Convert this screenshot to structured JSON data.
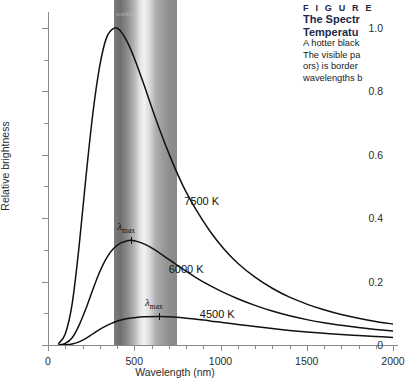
{
  "figure": {
    "label": "F I G U R E",
    "title_line1": "The Spectr",
    "title_line2": "Temperatu",
    "body_line1": "A hotter black",
    "body_line2": "The visible pa",
    "body_line3": "ors) is border",
    "body_line4": "wavelengths b",
    "title_color": "#1b2a4a"
  },
  "band": {
    "caption": "visible",
    "start_nm": 380,
    "end_nm": 750
  },
  "chart_data": {
    "type": "line",
    "title": "",
    "xlabel": "Wavelength (nm)",
    "ylabel": "Relative brightness",
    "xlim": [
      0,
      2000
    ],
    "ylim": [
      0,
      1.05
    ],
    "xticks": [
      0,
      500,
      1000,
      1500,
      2000
    ],
    "xtick_labels": [
      "0",
      "500",
      "1000",
      "1500",
      "2000"
    ],
    "xminor_step": 100,
    "yticks": [
      0,
      0.2,
      0.4,
      0.6,
      0.8,
      1.0
    ],
    "ytick_labels": [
      "0",
      "0.2",
      "0.4",
      "0.6",
      "0.8",
      "1.0"
    ],
    "yminor_step": 0.1,
    "grid": false,
    "legend": "inline-annotations",
    "series": [
      {
        "name": "7500 K",
        "label": "7500 K",
        "label_x_nm": 790,
        "label_y": 0.45,
        "peak_nm": 386,
        "peak_value": 1.0,
        "x": [
          60,
          100,
          140,
          180,
          220,
          260,
          300,
          340,
          386,
          420,
          460,
          500,
          560,
          620,
          700,
          780,
          860,
          940,
          1020,
          1100,
          1200,
          1300,
          1400,
          1500,
          1600,
          1700,
          1800,
          1900,
          2000
        ],
        "y": [
          0.004,
          0.035,
          0.13,
          0.31,
          0.53,
          0.73,
          0.88,
          0.97,
          1.0,
          0.99,
          0.955,
          0.905,
          0.815,
          0.72,
          0.605,
          0.505,
          0.425,
          0.358,
          0.303,
          0.258,
          0.214,
          0.179,
          0.151,
          0.129,
          0.111,
          0.096,
          0.084,
          0.074,
          0.066
        ]
      },
      {
        "name": "6000 K",
        "label": "6000 K",
        "label_x_nm": 700,
        "label_y": 0.235,
        "peak_nm": 483,
        "peak_value": 0.33,
        "lambda_max_label": "λmax",
        "x": [
          60,
          100,
          140,
          180,
          220,
          260,
          300,
          340,
          380,
          420,
          460,
          483,
          520,
          560,
          620,
          700,
          780,
          860,
          940,
          1020,
          1100,
          1200,
          1300,
          1400,
          1500,
          1600,
          1700,
          1800,
          1900,
          2000
        ],
        "y": [
          0.0004,
          0.005,
          0.023,
          0.062,
          0.115,
          0.175,
          0.231,
          0.275,
          0.304,
          0.321,
          0.329,
          0.33,
          0.326,
          0.318,
          0.3,
          0.27,
          0.24,
          0.212,
          0.187,
          0.165,
          0.146,
          0.125,
          0.107,
          0.092,
          0.08,
          0.07,
          0.062,
          0.055,
          0.049,
          0.044
        ]
      },
      {
        "name": "4500 K",
        "label": "4500 K",
        "label_x_nm": 880,
        "label_y": 0.095,
        "peak_nm": 644,
        "peak_value": 0.09,
        "lambda_max_label": "λmax",
        "x": [
          60,
          100,
          140,
          180,
          220,
          260,
          300,
          340,
          380,
          440,
          500,
          560,
          644,
          700,
          780,
          860,
          940,
          1020,
          1100,
          1200,
          1300,
          1400,
          1500,
          1600,
          1700,
          1800,
          1900,
          2000
        ],
        "y": [
          2e-05,
          0.0005,
          0.003,
          0.01,
          0.021,
          0.035,
          0.049,
          0.061,
          0.071,
          0.081,
          0.086,
          0.089,
          0.09,
          0.089,
          0.086,
          0.081,
          0.076,
          0.07,
          0.065,
          0.058,
          0.052,
          0.046,
          0.041,
          0.037,
          0.033,
          0.03,
          0.027,
          0.024
        ]
      }
    ]
  }
}
